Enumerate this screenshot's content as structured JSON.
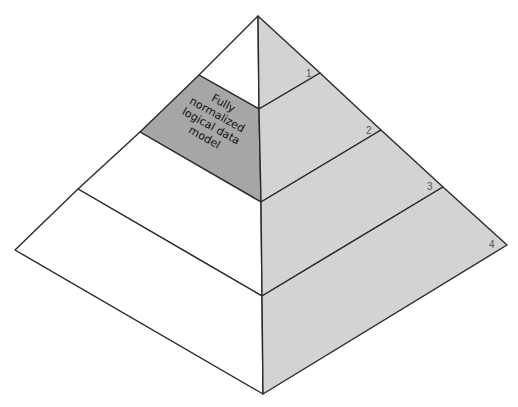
{
  "diagram": {
    "type": "pyramid",
    "tier_count": 4,
    "highlighted_tier": 2,
    "callout": {
      "lines": [
        "Fully",
        "normalized",
        "logical data",
        "model"
      ]
    },
    "tier_labels": [
      "1",
      "2",
      "3",
      "4"
    ],
    "colors": {
      "left_face": "#ffffff",
      "highlight": "#a6a6a6",
      "right_face": "#d3d3d3",
      "outline": "#2a2a2a"
    }
  }
}
